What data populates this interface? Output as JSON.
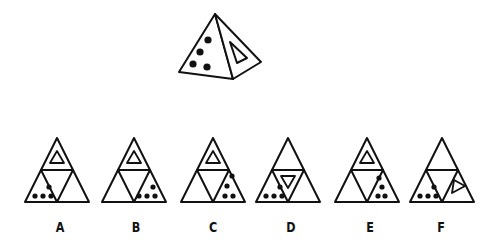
{
  "puzzle": {
    "type": "pyramid-net-matching",
    "question_figure": {
      "shape": "square-pyramid-3d",
      "left_face": {
        "symbol": "dots",
        "count": 4
      },
      "right_face": {
        "symbol": "triangle-outline",
        "count": 1
      }
    },
    "options": [
      {
        "label": "A",
        "top": "triangle-outline",
        "center": "empty",
        "left": "dots-4",
        "right": "empty"
      },
      {
        "label": "B",
        "top": "triangle-outline",
        "center": "empty",
        "left": "empty",
        "right": "dots-4"
      },
      {
        "label": "C",
        "top": "triangle-outline",
        "center": "empty",
        "left": "empty",
        "right": "dots-4"
      },
      {
        "label": "D",
        "top": "empty",
        "center": "inverted-triangle-outline",
        "left": "dots-4",
        "right": "empty"
      },
      {
        "label": "E",
        "top": "triangle-outline",
        "center": "empty",
        "left": "empty",
        "right": "dots-4"
      },
      {
        "label": "F",
        "top": "empty",
        "center": "empty",
        "left": "dots-4",
        "right": "rotated-triangle-outline"
      }
    ]
  },
  "colors": {
    "stroke": "#111111",
    "background": "#ffffff"
  }
}
